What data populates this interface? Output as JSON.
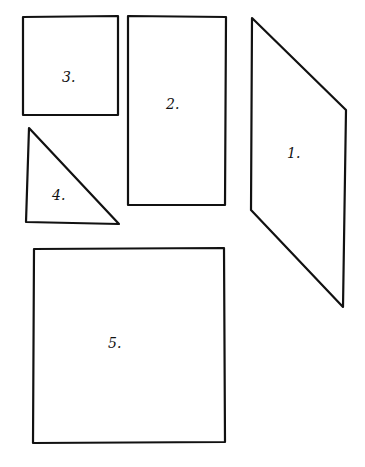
{
  "diagram": {
    "background": "#ffffff",
    "stroke_color": "#111111",
    "shapes": [
      {
        "id": 1,
        "type": "parallelogram",
        "label": "1.",
        "points": [
          [
            252,
            18
          ],
          [
            346,
            110
          ],
          [
            343,
            307
          ],
          [
            251,
            210
          ]
        ],
        "label_pos": [
          287,
          158
        ]
      },
      {
        "id": 2,
        "type": "rectangle",
        "label": "2.",
        "points": [
          [
            128,
            16
          ],
          [
            226,
            17
          ],
          [
            225,
            205
          ],
          [
            128,
            205
          ]
        ],
        "label_pos": [
          166,
          109
        ]
      },
      {
        "id": 3,
        "type": "square",
        "label": "3.",
        "points": [
          [
            23,
            17
          ],
          [
            118,
            16
          ],
          [
            118,
            115
          ],
          [
            23,
            115
          ]
        ],
        "label_pos": [
          62,
          82
        ]
      },
      {
        "id": 4,
        "type": "right-triangle",
        "label": "4.",
        "points": [
          [
            29,
            128
          ],
          [
            119,
            224
          ],
          [
            26,
            222
          ]
        ],
        "label_pos": [
          52,
          200
        ]
      },
      {
        "id": 5,
        "type": "square",
        "label": "5.",
        "points": [
          [
            34,
            249
          ],
          [
            224,
            248
          ],
          [
            225,
            442
          ],
          [
            33,
            443
          ]
        ],
        "label_pos": [
          108,
          348
        ]
      }
    ]
  }
}
